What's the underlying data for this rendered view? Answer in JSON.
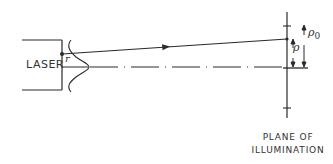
{
  "diagram": {
    "laser_label": "LASER",
    "offset_label": "r",
    "rho_label": "ρ",
    "rho0_label": "ρ",
    "rho0_subscript": "0",
    "plane_label_line1": "PLANE OF",
    "plane_label_line2": "ILLUMINATION",
    "colors": {
      "line": "#2a2a2a",
      "text": "#333333",
      "background": "#ffffff"
    }
  }
}
